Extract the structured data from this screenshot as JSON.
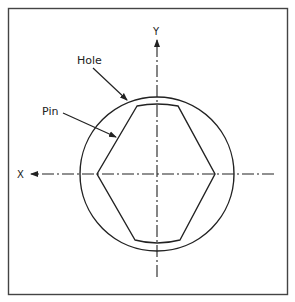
{
  "diagram": {
    "type": "engineering-cross-section",
    "labels": {
      "hole": "Hole",
      "pin": "Pin",
      "x_axis": "X",
      "y_axis": "Y"
    },
    "colors": {
      "line": "#222222",
      "background": "#ffffff",
      "frame": "#444444"
    },
    "shapes": {
      "hole": {
        "shape": "circle",
        "cx": 157,
        "cy": 174,
        "r": 77
      },
      "pin": {
        "shape": "diamond-pin",
        "vertices": [
          [
            137,
            106
          ],
          [
            178,
            106
          ],
          [
            215,
            174
          ],
          [
            180,
            240
          ],
          [
            135,
            240
          ],
          [
            97,
            174
          ]
        ]
      }
    },
    "axes": {
      "x": {
        "direction": "left",
        "from": [
          274,
          174
        ],
        "to": [
          29,
          174
        ]
      },
      "y": {
        "direction": "up",
        "from": [
          157,
          277
        ],
        "to": [
          157,
          38
        ]
      }
    }
  }
}
